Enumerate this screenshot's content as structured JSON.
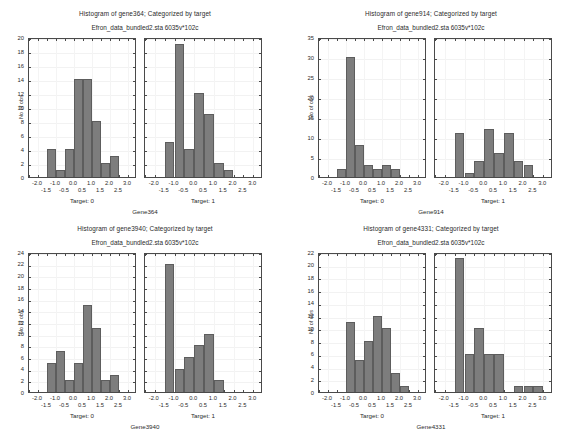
{
  "page": {
    "background": "#ffffff",
    "bar_color": "#7d7d7d",
    "bar_edge_color": "#5d5d5d",
    "axis_color": "#4a4a4a",
    "text_color": "#2b2b2b"
  },
  "shared": {
    "subtitle": "Efron_data_bundled2.sta 6035v*102c",
    "ylabel": "No of obs",
    "xcaption_left": "Target: 0",
    "xcaption_right": "Target: 1",
    "xticks_upper": [
      "-2.0",
      "-1.0",
      "0.0",
      "1.0",
      "2.0",
      "3.0"
    ],
    "xticks_lower": [
      "-1.5",
      "-0.5",
      "0.5",
      "1.5",
      "2.5"
    ],
    "xlim": [
      -2.5,
      3.5
    ],
    "bin_width": 0.5
  },
  "panels": [
    {
      "id": "gene364",
      "title": "Histogram of gene364; Categorized by target",
      "subtitle": "Efron_data_bundled2.sta 6035v*102c",
      "gene_caption": "Gene364",
      "ylim": [
        0,
        20
      ],
      "yticks": [
        "0",
        "2",
        "4",
        "6",
        "8",
        "10",
        "12",
        "14",
        "16",
        "18",
        "20"
      ],
      "ytick_values": [
        0,
        2,
        4,
        6,
        8,
        10,
        12,
        14,
        16,
        18,
        20
      ],
      "chart_data": {
        "type": "bar",
        "title": "Histogram of gene364; Categorized by target",
        "subtitle": "Efron_data_bundled2.sta 6035v*102c",
        "xlabel": "Gene364",
        "ylabel": "No of obs",
        "ylim": [
          0,
          20
        ],
        "xlim": [
          -2.5,
          3.5
        ],
        "grid": true,
        "legend": "none",
        "series": [
          {
            "name": "Target: 0",
            "bin_edges": [
              -1.5,
              -1.0,
              -0.5,
              0.0,
              0.5,
              1.0,
              1.5,
              2.0,
              2.5
            ],
            "values": [
              4,
              1,
              4,
              14,
              14,
              8,
              2,
              3
            ]
          },
          {
            "name": "Target: 1",
            "bin_edges": [
              -1.5,
              -1.0,
              -0.5,
              0.0,
              0.5,
              1.0,
              1.5,
              2.0
            ],
            "values": [
              5,
              19,
              4,
              12,
              9,
              2,
              1
            ]
          }
        ]
      }
    },
    {
      "id": "gene914",
      "title": "Histogram of gene914; Categorized by target",
      "subtitle": "Efron_data_bundled2.sta 6035v*102c",
      "gene_caption": "Gene914",
      "ylim": [
        0,
        35
      ],
      "yticks": [
        "0",
        "5",
        "10",
        "15",
        "20",
        "25",
        "30",
        "35"
      ],
      "ytick_values": [
        0,
        5,
        10,
        15,
        20,
        25,
        30,
        35
      ],
      "chart_data": {
        "type": "bar",
        "title": "Histogram of gene914; Categorized by target",
        "subtitle": "Efron_data_bundled2.sta 6035v*102c",
        "xlabel": "Gene914",
        "ylabel": "No of obs",
        "ylim": [
          0,
          35
        ],
        "xlim": [
          -2.5,
          3.5
        ],
        "grid": true,
        "legend": "none",
        "series": [
          {
            "name": "Target: 0",
            "bin_edges": [
              -1.5,
              -1.0,
              -0.5,
              0.0,
              0.5,
              1.0,
              1.5,
              2.0
            ],
            "values": [
              2,
              30,
              8,
              3,
              2,
              3,
              2
            ]
          },
          {
            "name": "Target: 1",
            "bin_edges": [
              -1.5,
              -1.0,
              -0.5,
              0.0,
              0.5,
              1.0,
              1.5,
              2.0,
              2.5
            ],
            "values": [
              11,
              1,
              4,
              12,
              6,
              11,
              4,
              3
            ]
          }
        ]
      }
    },
    {
      "id": "gene3940",
      "title": "Histogram of gene3940; Categorized by target",
      "subtitle": "Efron_data_bundled2.sta 6035v*102c",
      "gene_caption": "Gene3940",
      "ylim": [
        0,
        24
      ],
      "yticks": [
        "0",
        "2",
        "4",
        "6",
        "8",
        "10",
        "12",
        "14",
        "16",
        "18",
        "20",
        "22",
        "24"
      ],
      "ytick_values": [
        0,
        2,
        4,
        6,
        8,
        10,
        12,
        14,
        16,
        18,
        20,
        22,
        24
      ],
      "chart_data": {
        "type": "bar",
        "title": "Histogram of gene3940; Categorized by target",
        "subtitle": "Efron_data_bundled2.sta 6035v*102c",
        "xlabel": "Gene3940",
        "ylabel": "No of obs",
        "ylim": [
          0,
          24
        ],
        "xlim": [
          -2.5,
          3.5
        ],
        "grid": true,
        "legend": "none",
        "series": [
          {
            "name": "Target: 0",
            "bin_edges": [
              -1.5,
              -1.0,
              -0.5,
              0.0,
              0.5,
              1.0,
              1.5,
              2.0,
              2.5
            ],
            "values": [
              5,
              7,
              2,
              5,
              15,
              11,
              2,
              3
            ]
          },
          {
            "name": "Target: 1",
            "bin_edges": [
              -1.5,
              -1.0,
              -0.5,
              0.0,
              0.5,
              1.0,
              1.5
            ],
            "values": [
              22,
              4,
              6,
              8,
              10,
              2
            ]
          }
        ]
      }
    },
    {
      "id": "gene4331",
      "title": "Histogram of gene4331; Categorized by target",
      "subtitle": "Efron_data_bundled2.sta 6035v*102c",
      "gene_caption": "Gene4331",
      "ylim": [
        0,
        22
      ],
      "yticks": [
        "0",
        "2",
        "4",
        "6",
        "8",
        "10",
        "12",
        "14",
        "16",
        "18",
        "20",
        "22"
      ],
      "ytick_values": [
        0,
        2,
        4,
        6,
        8,
        10,
        12,
        14,
        16,
        18,
        20,
        22
      ],
      "chart_data": {
        "type": "bar",
        "title": "Histogram of gene4331; Categorized by target",
        "subtitle": "Efron_data_bundled2.sta 6035v*102c",
        "xlabel": "Gene4331",
        "ylabel": "No of obs",
        "ylim": [
          0,
          22
        ],
        "xlim": [
          -2.5,
          3.5
        ],
        "grid": true,
        "legend": "none",
        "series": [
          {
            "name": "Target: 0",
            "bin_edges": [
              -1.0,
              -0.5,
              0.0,
              0.5,
              1.0,
              1.5,
              2.0,
              2.5
            ],
            "values": [
              11,
              5,
              8,
              12,
              10,
              3,
              1
            ]
          },
          {
            "name": "Target: 1",
            "bin_edges": [
              -1.5,
              -1.0,
              -0.5,
              0.0,
              0.5,
              1.0,
              1.5,
              2.0,
              2.5,
              3.0
            ],
            "values": [
              21,
              6,
              10,
              6,
              6,
              0,
              1,
              1,
              1
            ]
          }
        ]
      }
    }
  ]
}
